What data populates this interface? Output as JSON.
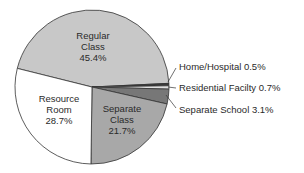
{
  "chart_data": {
    "type": "pie",
    "title": "",
    "slices": [
      {
        "label": "Regular Class",
        "value": 45.4,
        "color": "#c8c8c8",
        "text_lines": [
          "Regular",
          "Class",
          "45.4%"
        ]
      },
      {
        "label": "Home/Hospital",
        "value": 0.5,
        "color": "#3a3a3a",
        "text_lines": [
          "Home/Hospital 0.5%"
        ]
      },
      {
        "label": "Residential Facilty",
        "value": 0.7,
        "color": "#e0e0e0",
        "text_lines": [
          "Residential Facilty 0.7%"
        ]
      },
      {
        "label": "Separate School",
        "value": 3.1,
        "color": "#777777",
        "text_lines": [
          "Separate School 3.1%"
        ]
      },
      {
        "label": "Separate Class",
        "value": 21.7,
        "color": "#a8a8a8",
        "text_lines": [
          "Separate",
          "Class",
          "21.7%"
        ]
      },
      {
        "label": "Resource Room",
        "value": 28.7,
        "color": "#ffffff",
        "text_lines": [
          "Resource",
          "Room",
          "28.7%"
        ]
      }
    ]
  }
}
